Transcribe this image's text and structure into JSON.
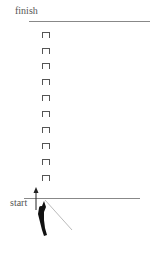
{
  "labels": {
    "finish": "finish",
    "start": "start"
  },
  "markers": {
    "count": 10,
    "icon": "staple-marker-icon"
  },
  "figure": {
    "icon": "climber-figure-icon",
    "arrow": "up-arrow-icon"
  },
  "colors": {
    "line": "#888888",
    "marker": "#555555",
    "figure": "#111111",
    "rope": "#bbbbbb"
  }
}
